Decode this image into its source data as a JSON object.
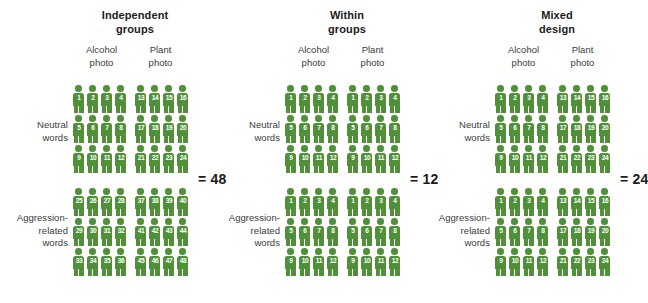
{
  "figure": {
    "type": "diagram",
    "icon_color": "#4f9039",
    "background": "#ffffff",
    "row_labels": {
      "neutral": "Neutral\nwords",
      "aggression": "Aggression-\nrelated\nwords"
    },
    "column_headers": {
      "alcohol": "Alcohol\nphoto",
      "plant": "Plant\nphoto"
    }
  },
  "panels": [
    {
      "id": "independent-groups",
      "title": "Independent\ngroups",
      "total_label": "= 48",
      "total_value": 48,
      "row_label_neutral": "Neutral\nwords",
      "row_label_aggression": "Aggression-\nrelated\nwords",
      "header_alcohol": "Alcohol\nphoto",
      "header_plant": "Plant\nphoto",
      "blocks": {
        "neutral_alcohol": [
          1,
          2,
          3,
          4,
          5,
          6,
          7,
          8,
          9,
          10,
          11,
          12
        ],
        "neutral_plant": [
          13,
          14,
          15,
          16,
          17,
          18,
          19,
          20,
          21,
          22,
          23,
          24
        ],
        "aggression_alcohol": [
          25,
          26,
          27,
          28,
          29,
          30,
          31,
          32,
          33,
          34,
          35,
          36
        ],
        "aggression_plant": [
          37,
          38,
          39,
          40,
          41,
          42,
          43,
          44,
          45,
          46,
          47,
          48
        ]
      }
    },
    {
      "id": "within-groups",
      "title": "Within\ngroups",
      "total_label": "= 12",
      "total_value": 12,
      "row_label_neutral": "Neutral\nwords",
      "row_label_aggression": "Aggression-\nrelated\nwords",
      "header_alcohol": "Alcohol\nphoto",
      "header_plant": "Plant\nphoto",
      "blocks": {
        "neutral_alcohol": [
          1,
          2,
          3,
          4,
          5,
          6,
          7,
          8,
          9,
          10,
          11,
          12
        ],
        "neutral_plant": [
          1,
          2,
          3,
          4,
          5,
          6,
          7,
          8,
          9,
          10,
          11,
          12
        ],
        "aggression_alcohol": [
          1,
          2,
          3,
          4,
          5,
          6,
          7,
          8,
          9,
          10,
          11,
          12
        ],
        "aggression_plant": [
          1,
          2,
          3,
          4,
          5,
          6,
          7,
          8,
          9,
          10,
          11,
          12
        ]
      }
    },
    {
      "id": "mixed-design",
      "title": "Mixed\ndesign",
      "total_label": "= 24",
      "total_value": 24,
      "row_label_neutral": "Neutral\nwords",
      "row_label_aggression": "Aggression-\nrelated\nwords",
      "header_alcohol": "Alcohol\nphoto",
      "header_plant": "Plant\nphoto",
      "blocks": {
        "neutral_alcohol": [
          1,
          2,
          3,
          4,
          5,
          6,
          7,
          8,
          9,
          10,
          11,
          12
        ],
        "neutral_plant": [
          13,
          14,
          15,
          16,
          17,
          18,
          19,
          20,
          21,
          22,
          23,
          24
        ],
        "aggression_alcohol": [
          1,
          2,
          3,
          4,
          5,
          6,
          7,
          8,
          9,
          10,
          11,
          12
        ],
        "aggression_plant": [
          13,
          14,
          15,
          16,
          17,
          18,
          19,
          20,
          21,
          22,
          23,
          24
        ]
      }
    }
  ]
}
